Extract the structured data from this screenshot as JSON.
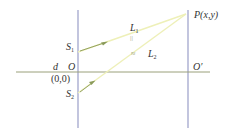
{
  "diagram": {
    "type": "double-slit geometry",
    "colors": {
      "screen_lines": "#9a9ec8",
      "axis_line": "#9aa07a",
      "ray_lines": "#eef0b8",
      "arrow": "#8a9a5a",
      "text": "#333333"
    },
    "labels": {
      "s1": {
        "main": "S",
        "sub": "1"
      },
      "s2": {
        "main": "S",
        "sub": "2"
      },
      "l1": {
        "main": "L",
        "sub": "1"
      },
      "l2": {
        "main": "L",
        "sub": "2"
      },
      "point_p": "P(x,y)",
      "origin_o": "O",
      "origin_coords": "(0,0)",
      "o_prime": "O′",
      "distance_d": "d",
      "tick_l1": "||",
      "tick_l2": "≈"
    }
  }
}
